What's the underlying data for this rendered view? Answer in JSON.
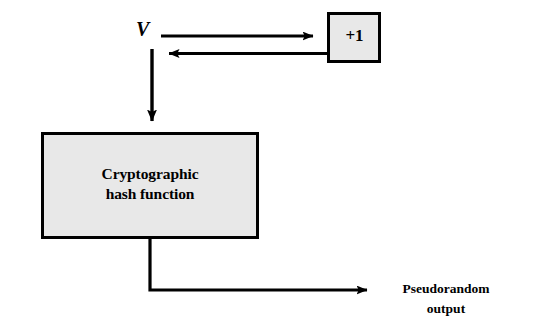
{
  "diagram": {
    "background_color": "#ffffff",
    "stroke_color": "#000000",
    "box_fill_color": "#e8e8e8"
  },
  "nodes": {
    "seed": {
      "label": "V",
      "style": "italic-serif-bold"
    },
    "increment": {
      "label": "+1",
      "fill": "#e8e8e8",
      "border": "#000000"
    },
    "hash": {
      "label_line1": "Cryptographic",
      "label_line2": "hash function",
      "label": "Cryptographic\nhash function",
      "fill": "#e8e8e8",
      "border": "#000000"
    },
    "output": {
      "label_line1": "Pseudorandom",
      "label_line2": "output",
      "label": "Pseudorandom\noutput"
    }
  },
  "edges": [
    {
      "name": "seed-to-increment",
      "from": "V",
      "to": "+1",
      "direction": "right"
    },
    {
      "name": "increment-to-seed",
      "from": "+1",
      "to": "V",
      "direction": "left"
    },
    {
      "name": "seed-to-hash",
      "from": "V",
      "to": "Cryptographic hash function",
      "direction": "down"
    },
    {
      "name": "hash-to-output",
      "from": "Cryptographic hash function",
      "to": "Pseudorandom output",
      "direction": "right"
    }
  ]
}
